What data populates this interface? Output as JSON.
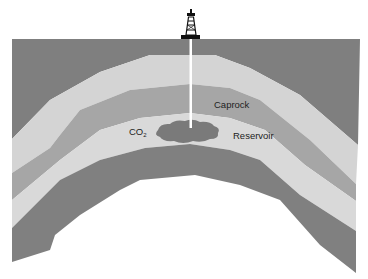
{
  "diagram": {
    "labels": {
      "caprock": "Caprock",
      "reservoir": "Reservoir",
      "co2_main": "CO",
      "co2_sub": "2"
    },
    "colors": {
      "overburden": "#7f7f7f",
      "upper_light_layer": "#d4d4d4",
      "caprock": "#a6a6a6",
      "reservoir": "#d9d9d9",
      "basement": "#808080",
      "co2_plume": "#7a7a7a",
      "well": "#ffffff",
      "derrick": "#111111",
      "background": "#ffffff"
    },
    "elements": [
      "drilling-rig",
      "injection-well",
      "overburden",
      "upper-layer",
      "caprock",
      "reservoir",
      "co2-plume",
      "basement"
    ]
  }
}
